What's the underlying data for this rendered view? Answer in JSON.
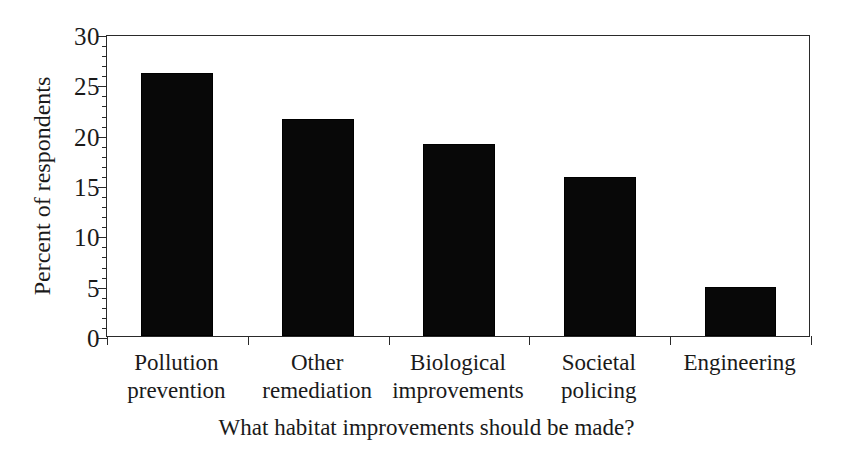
{
  "chart_data": {
    "type": "bar",
    "title": "",
    "xlabel": "What habitat improvements should be made?",
    "ylabel": "Percent of respondents",
    "categories": [
      "Pollution\nprevention",
      "Other\nremediation",
      "Biological\nimprovements",
      "Societal\npolicing",
      "Engineering"
    ],
    "category_lines": [
      [
        "Pollution",
        "prevention"
      ],
      [
        "Other",
        "remediation"
      ],
      [
        "Biological",
        "improvements"
      ],
      [
        "Societal",
        "policing"
      ],
      [
        "Engineering"
      ]
    ],
    "values": [
      26.1,
      21.6,
      19.1,
      15.8,
      4.9
    ],
    "ylim": [
      0,
      30
    ],
    "ytick_labels": [
      "0",
      "5",
      "10",
      "15",
      "20",
      "25",
      "30"
    ],
    "ytick_values": [
      0,
      5,
      10,
      15,
      20,
      25,
      30
    ],
    "yminor_step": 1,
    "grid": false,
    "legend": "none",
    "bar_color": "#080808",
    "axis_color": "#2a2a2a",
    "background_color": "#ffffff"
  }
}
